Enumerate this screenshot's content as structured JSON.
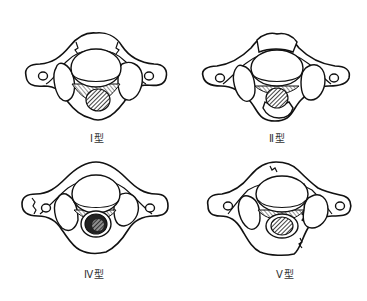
{
  "figure": {
    "panels": [
      {
        "id": "type-1",
        "label": "Ⅰ型"
      },
      {
        "id": "type-2",
        "label": "Ⅱ型"
      },
      {
        "id": "type-4",
        "label": "Ⅳ型"
      },
      {
        "id": "type-5",
        "label": "Ⅴ型"
      }
    ]
  },
  "colors": {
    "line": "#111111",
    "background": "#ffffff",
    "label_text": "#333333"
  }
}
